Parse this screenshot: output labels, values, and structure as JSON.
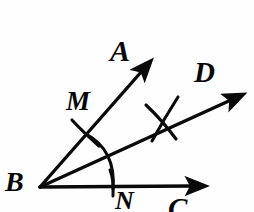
{
  "figure": {
    "kind": "angle-bisector-construction",
    "background_color": "#fefefe",
    "ink_color": "#0a0a0a",
    "width": 254,
    "height": 212,
    "labels": {
      "A": "A",
      "B": "B",
      "C": "C",
      "D": "D",
      "M": "M",
      "N": "N"
    },
    "points": {
      "B": {
        "x": 40,
        "y": 187
      },
      "A_tip": {
        "x": 146,
        "y": 67
      },
      "D_tip": {
        "x": 236,
        "y": 97
      },
      "C_tip": {
        "x": 197,
        "y": 186
      },
      "M": {
        "x": 88,
        "y": 132
      },
      "N": {
        "x": 112,
        "y": 187
      },
      "cross": {
        "x": 163,
        "y": 120
      }
    },
    "rays": [
      {
        "name": "ray-BA",
        "from": "B",
        "to": "A_tip",
        "arrow": true
      },
      {
        "name": "ray-BD",
        "from": "B",
        "to": "D_tip",
        "arrow": true
      },
      {
        "name": "ray-BC",
        "from": "B",
        "to": "C_tip",
        "arrow": true
      }
    ],
    "arcs": [
      {
        "name": "arc-MN",
        "through": [
          "M",
          "N"
        ],
        "center": "B",
        "radius": 75
      },
      {
        "name": "arc-from-M",
        "center": "M",
        "note": "short construction arc crossing at cross point"
      },
      {
        "name": "arc-from-N",
        "center": "N",
        "note": "short construction arc crossing at cross point"
      }
    ]
  }
}
